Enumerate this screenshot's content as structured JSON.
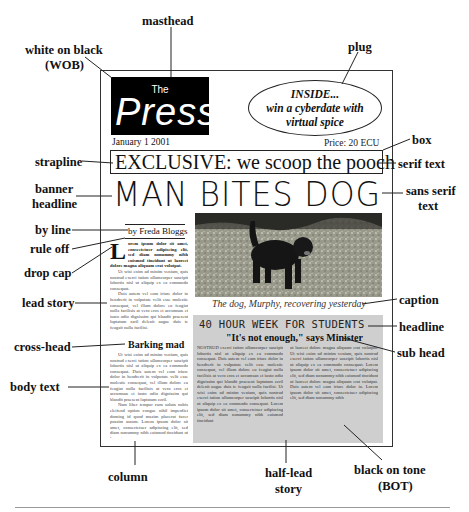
{
  "diagram": {
    "type": "annotated newspaper front page",
    "labels": {
      "masthead": "masthead",
      "wob": [
        "white on black",
        "(WOB)"
      ],
      "plug": "plug",
      "box": "box",
      "strapline": "strapline",
      "serif_text": "serif text",
      "banner_headline": [
        "banner",
        "headline"
      ],
      "sans_serif_text": [
        "sans serif",
        "text"
      ],
      "by_line": "by line",
      "rule_off": "rule off",
      "drop_cap": "drop cap",
      "lead_story": "lead story",
      "caption": "caption",
      "headline": "headline",
      "cross_head": "cross-head",
      "sub_head": "sub head",
      "body_text": "body text",
      "column": "column",
      "half_lead_story": [
        "half-lead",
        "story"
      ],
      "black_on_tone": [
        "black on tone",
        "(BOT)"
      ]
    }
  },
  "newspaper": {
    "masthead_the": "The",
    "masthead_name": "Press",
    "plug_lines": [
      "INSIDE...",
      "win a cyberdate with",
      "virtual spice"
    ],
    "date": "January 1 2001",
    "price": "Price: 20 ECU",
    "strapline": "EXCLUSIVE: we scoop the pooch",
    "banner": "MAN BITES DOG",
    "byline": "by Freda Bloggs",
    "dropcap": "L",
    "lead_para1": "orem ipsum dolor sit amet, consectetuer adipiscing elit, sed diam nonummy nibh euismod tincidunt ut laoreet dolore magna aliquam erat volutpat.",
    "lead_para2": "Ut wisi enim ad minim veniam, quis nostrud exerci tation ullamcorper suscipit lobortis nisl ut aliquip ex ea commodo consequat.",
    "lead_para3": "Duis autem vel eum iriure dolor in hendrerit in vulputate velit esse molestie consequat, vel illum dolore eu feugiat nulla facilisis at vero eros et accumsan et iusto odio dignissim qui blandit praesent luptatum zzril delenit augue duis te feugait nulla facilisi.",
    "crosshead": "Barking mad",
    "body_para1": "Ut wisi enim ad minim veniam, quis nostrud exerci tation ullamcorper suscipit lobortis nisl ut aliquip ex ea commodo consequat. Duis autem vel eum iriure dolor in hendrerit in vulputate velit esse molestie consequat, vel illum dolore eu feugiat nulla facilisis at vero eros et accumsan et iusto odio dignissim qui blandit praesent luptatum zzril.",
    "body_para2": "Nam liber tempor cum soluta nobis eleifend option congue nihil imperdiet doming id quod mazim placerat facer possim assum. Lorem ipsum dolor sit amet, consectetuer adipiscing elit, sed diam nonummy nibh euismod tincidunt ut laoreet",
    "caption": "The dog, Murphy, recovering yesterday",
    "half_lead_headline": "40 HOUR WEEK FOR STUDENTS",
    "half_lead_subhead": "\"It's not enough,\" says Minister",
    "half_lead_col1": "NOSTRUD exerci tation ullamcorper suscipit lobortis nisl ut aliquip ex ea commodo consequat. Duis autem vel eum iriure dolor in hendrerit in vulputate velit esse molestie consequat, vel illum dolore eu feugiat nulla facilisis at vero eros et accumsan et iusto odio dignissim qui blandit praesent luptatum zzril delenit augue duis te feugait nulla facilisi. Ut wisi enim ad minim veniam, quis nostrud exerci tation ullamcorper suscipit lobortis nisl ut aliquip ex ea commodo consequat. Lorem ipsum dolor sit amet, consectetuer adipiscing elit, sed diam nonummy nibh euismod tincidunt",
    "half_lead_col2": "ut laoreet dolore magna aliquam erat volutpat. Ut wisi enim ad minim veniam, quis nostrud exerci tation ullamcorper suscipit lobortis nisl ut aliquip ex ea commodo consequat. Lorem ipsum dolor sit amet, consectetuer adipiscing elit, sed diam nonummy nibh euismod tincidunt ut laoreet dolore magna aliquam erat volutpat. Duis autem vel eum iriure dolor in. Lorem ipsum dolor sit amet, consectetuer adipiscing elit, sed diam nonummy nibh"
  },
  "colors": {
    "masthead_bg": "#000000",
    "tone_bg": "#cfcfcf",
    "text": "#111111"
  }
}
